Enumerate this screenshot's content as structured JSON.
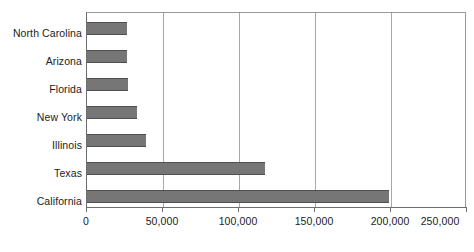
{
  "chart_data": {
    "type": "bar",
    "orientation": "horizontal",
    "title": "",
    "subtitle": "",
    "xlabel": "",
    "ylabel": "",
    "categories": [
      "North Carolina",
      "Arizona",
      "Florida",
      "New York",
      "Illinois",
      "Texas",
      "California"
    ],
    "values": [
      26000,
      26000,
      27000,
      33000,
      39000,
      117000,
      199000
    ],
    "series": [
      {
        "name": "",
        "values": [
          26000,
          26000,
          27000,
          33000,
          39000,
          117000,
          199000
        ]
      }
    ],
    "xlim": [
      0,
      250000
    ],
    "xticks": [
      0,
      50000,
      100000,
      150000,
      200000,
      250000
    ],
    "xtick_labels": [
      "0",
      "50,000",
      "100,000",
      "150,000",
      "200,000",
      "250,000"
    ],
    "grid": {
      "vertical": true,
      "horizontal": false
    },
    "legend": {
      "visible": false,
      "position": "none",
      "entries": []
    },
    "annotations": [],
    "colors": {
      "bar_fill": "#767676",
      "bar_edge": "#4f4f4f",
      "gridline": "#a8a8a8",
      "axis": "#6e6e6e",
      "plot_background": "#ffffff",
      "text": "#1c1c1c"
    }
  }
}
